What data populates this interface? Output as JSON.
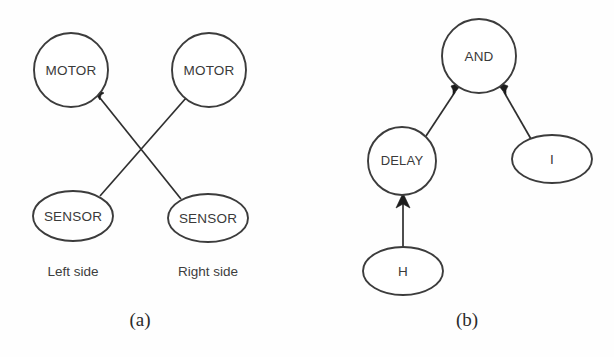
{
  "figure": {
    "background_color": "#fefefe",
    "stroke_color": "#3c3c3c",
    "text_color": "#3a3a3a",
    "arrow_color": "#1c1c1c",
    "panels": [
      {
        "id": "panel-a",
        "caption": "(a)",
        "nodes": [
          {
            "id": "motor-left",
            "label": "MOTOR",
            "shape": "circle",
            "cx": 71,
            "cy": 70,
            "r": 37
          },
          {
            "id": "motor-right",
            "label": "MOTOR",
            "shape": "circle",
            "cx": 209,
            "cy": 70,
            "r": 37
          },
          {
            "id": "sensor-left",
            "label": "SENSOR",
            "shape": "ellipse",
            "cx": 73,
            "cy": 216,
            "rx": 40,
            "ry": 25
          },
          {
            "id": "sensor-right",
            "label": "SENSOR",
            "shape": "ellipse",
            "cx": 208,
            "cy": 218,
            "rx": 40,
            "ry": 24
          }
        ],
        "edges": [
          {
            "id": "edge-sensor-left-to-motor-right",
            "from": "sensor-left",
            "to": "motor-right",
            "x1": 100,
            "y1": 196,
            "x2": 184,
            "y2": 97
          },
          {
            "id": "edge-sensor-right-to-motor-left",
            "from": "sensor-right",
            "to": "motor-left",
            "x1": 181,
            "y1": 199,
            "x2": 98,
            "y2": 97
          }
        ],
        "side_labels": [
          {
            "id": "left-side-label",
            "text": "Left side",
            "x": 73,
            "y": 272
          },
          {
            "id": "right-side-label",
            "text": "Right side",
            "x": 208,
            "y": 272
          }
        ]
      },
      {
        "id": "panel-b",
        "caption": "(b)",
        "nodes": [
          {
            "id": "and-gate",
            "label": "AND",
            "shape": "circle",
            "cx": 479,
            "cy": 56,
            "r": 37
          },
          {
            "id": "delay",
            "label": "DELAY",
            "shape": "circle",
            "cx": 402,
            "cy": 161,
            "r": 34
          },
          {
            "id": "input-i",
            "label": "I",
            "shape": "ellipse",
            "cx": 552,
            "cy": 159,
            "rx": 40,
            "ry": 24
          },
          {
            "id": "input-h",
            "label": "H",
            "shape": "ellipse",
            "cx": 403,
            "cy": 271,
            "rx": 40,
            "ry": 24
          }
        ],
        "edges": [
          {
            "id": "edge-delay-to-and",
            "from": "delay",
            "to": "and-gate",
            "x1": 426,
            "y1": 136,
            "x2": 453,
            "y2": 90
          },
          {
            "id": "edge-i-to-and",
            "from": "input-i",
            "to": "and-gate",
            "x1": 531,
            "y1": 139,
            "x2": 506,
            "y2": 90
          },
          {
            "id": "edge-h-to-delay",
            "from": "input-h",
            "to": "delay",
            "x1": 403,
            "y1": 247,
            "x2": 403,
            "y2": 197
          }
        ],
        "side_labels": []
      }
    ],
    "captions": [
      {
        "id": "caption-a",
        "text": "(a)",
        "x": 140,
        "y": 322
      },
      {
        "id": "caption-b",
        "text": "(b)",
        "x": 467,
        "y": 322
      }
    ]
  }
}
